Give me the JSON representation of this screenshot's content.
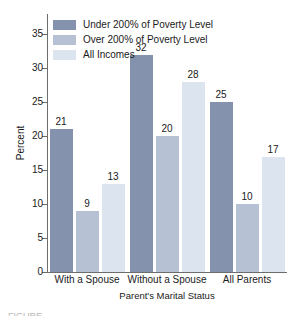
{
  "chart_data": {
    "type": "bar",
    "title": "",
    "xlabel": "Parent's Marital Status",
    "ylabel": "Percent",
    "categories": [
      "With a Spouse",
      "Without a Spouse",
      "All Parents"
    ],
    "series": [
      {
        "name": "Under 200% of Poverty Level",
        "color": "#8592ad",
        "values": [
          21,
          32,
          25
        ]
      },
      {
        "name": "Over 200% of Poverty Level",
        "color": "#b6c2d3",
        "values": [
          9,
          20,
          10
        ]
      },
      {
        "name": "All Incomes",
        "color": "#dce5ef",
        "values": [
          13,
          28,
          17
        ]
      }
    ],
    "ylim": [
      0,
      38
    ],
    "yticks": [
      0,
      5,
      10,
      15,
      20,
      25,
      30,
      35
    ],
    "grid": false,
    "legend_position": "top-left",
    "data_labels": true
  },
  "axes": {
    "y_label": "Percent",
    "x_label": "Parent's Marital Status"
  },
  "caption": {
    "text": "FIGURE"
  },
  "colors": {
    "axis": "#6d6d6d",
    "text": "#1a1a1a",
    "background": "#ffffff"
  }
}
